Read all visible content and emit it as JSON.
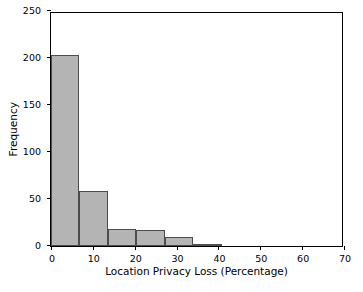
{
  "chart_data": {
    "type": "bar",
    "title": "",
    "subtitle": "",
    "xlabel": "Location Privacy Loss (Percentage)",
    "ylabel": "Frequency",
    "xlim": [
      0,
      70
    ],
    "ylim": [
      0,
      250
    ],
    "xticks": [
      0,
      10,
      20,
      30,
      40,
      50,
      60,
      70
    ],
    "xtick_labels": [
      "0",
      "10",
      "20",
      "30",
      "40",
      "50",
      "60",
      "70"
    ],
    "yticks": [
      0,
      50,
      100,
      150,
      200,
      250
    ],
    "ytick_labels": [
      "0",
      "50",
      "100",
      "150",
      "200",
      "250"
    ],
    "grid": false,
    "legend": null,
    "bar_color": "#b4b4b4",
    "bar_edge_color": "#4d4d4d",
    "axis_color": "#000000",
    "background": "#ffffff",
    "bin_edges": [
      0,
      6.8,
      13.6,
      20.4,
      27.2,
      34.0,
      40.8,
      47.6,
      54.4,
      61.2,
      68.0
    ],
    "bins": [
      {
        "start": 0,
        "end": 6.8,
        "value": 203
      },
      {
        "start": 6.8,
        "end": 13.6,
        "value": 58
      },
      {
        "start": 13.6,
        "end": 20.4,
        "value": 18
      },
      {
        "start": 20.4,
        "end": 27.2,
        "value": 17
      },
      {
        "start": 27.2,
        "end": 34.0,
        "value": 10
      },
      {
        "start": 34.0,
        "end": 40.8,
        "value": 1
      },
      {
        "start": 40.8,
        "end": 47.6,
        "value": 0
      },
      {
        "start": 47.6,
        "end": 54.4,
        "value": 0
      },
      {
        "start": 54.4,
        "end": 61.2,
        "value": 0
      },
      {
        "start": 61.2,
        "end": 68.0,
        "value": 0
      }
    ],
    "values": [
      203,
      58,
      18,
      17,
      10,
      1,
      0,
      0,
      0,
      0
    ],
    "categories": [
      "0-6.8",
      "6.8-13.6",
      "13.6-20.4",
      "20.4-27.2",
      "27.2-34",
      "34-40.8",
      "40.8-47.6",
      "47.6-54.4",
      "54.4-61.2",
      "61.2-68"
    ]
  }
}
